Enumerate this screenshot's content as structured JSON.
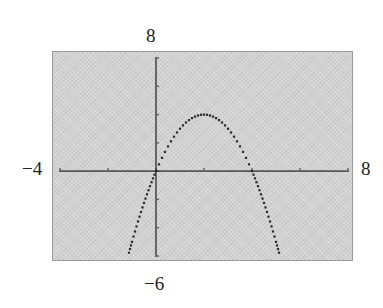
{
  "chart_data": {
    "type": "line",
    "title": "",
    "function": "y = -x^2 + 4x",
    "xlabel": "",
    "ylabel": "",
    "window": {
      "xmin": -4,
      "xmax": 8,
      "ymin": -6,
      "ymax": 8,
      "xscl": 2,
      "yscl": 2
    },
    "xlim": [
      -4,
      8
    ],
    "ylim": [
      -6,
      8
    ],
    "grid": false,
    "legend": null,
    "series": [
      {
        "name": "parabola",
        "x": [
          -1.1,
          -1,
          -0.5,
          0,
          0.5,
          1,
          1.5,
          2,
          2.5,
          3,
          3.5,
          4,
          4.5,
          5,
          5.1
        ],
        "y": [
          -5.61,
          -5,
          -2.25,
          0,
          1.75,
          3,
          3.75,
          4,
          3.75,
          3,
          1.75,
          0,
          -2.25,
          -5,
          -5.61
        ]
      }
    ],
    "annotations": {
      "vertex": [
        2,
        4
      ],
      "x_intercepts": [
        0,
        4
      ]
    }
  },
  "labels": {
    "ymax": "8",
    "ymin": "−6",
    "xmin": "−4",
    "xmax": "8"
  },
  "style": {
    "screen_bg": "#d2d2d2",
    "plot_color": "#2a2a2a",
    "axis_color": "#2a2a2a"
  }
}
